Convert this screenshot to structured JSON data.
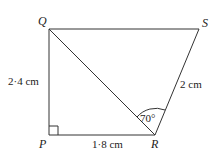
{
  "diagram": {
    "vertices": {
      "Q": {
        "label": "Q",
        "x": 49,
        "y": 29
      },
      "S": {
        "label": "S",
        "x": 199,
        "y": 29
      },
      "P": {
        "label": "P",
        "x": 49,
        "y": 135
      },
      "R": {
        "label": "R",
        "x": 155,
        "y": 135
      }
    },
    "measurements": {
      "QP": "2·4 cm",
      "PR": "1·8 cm",
      "RS": "2 cm",
      "angle_QRS": "70°"
    },
    "right_angle_at": "P",
    "stroke_color": "#333333"
  }
}
